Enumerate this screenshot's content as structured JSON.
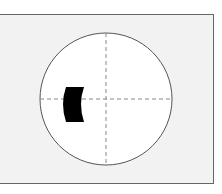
{
  "diagram": {
    "type": "visual-field-defect",
    "frame": {
      "background": "#f2f2f2",
      "border": "#666666"
    },
    "circle": {
      "cx": 106,
      "cy": 99,
      "r": 66,
      "fill": "#ffffff",
      "stroke": "#555555"
    },
    "crosshair": {
      "color": "#888888",
      "style": "dashed"
    },
    "defect": {
      "color": "#000000",
      "position": "left-central",
      "shape": "crescent-block"
    }
  }
}
